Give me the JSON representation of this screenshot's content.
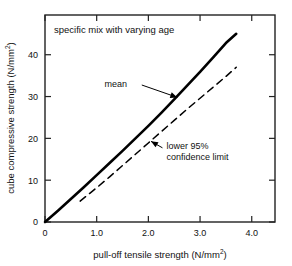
{
  "chart_data": {
    "type": "line",
    "title": "specific mix with varying age",
    "title_position": "inside-top-left",
    "xlabel_main": "pull-off tensile strength (N/mm",
    "xlabel_sup": "2",
    "xlabel_tail": ")",
    "xlabel_full": "pull-off tensile strength (N/mm2)",
    "ylabel_main": "cube compressive strength (N/mm",
    "ylabel_sup": "2",
    "ylabel_tail": ")",
    "ylabel_full": "cube compressive strength (N/mm2)",
    "xlim": [
      0,
      4.45
    ],
    "ylim": [
      0,
      49.5
    ],
    "xticks": [
      0,
      1.0,
      2.0,
      3.0,
      4.0
    ],
    "xticklabels": [
      "0",
      "1.0",
      "2.0",
      "3.0",
      "4.0"
    ],
    "yticks": [
      0,
      10,
      20,
      30,
      40
    ],
    "yticklabels": [
      "0",
      "10",
      "20",
      "30",
      "40"
    ],
    "grid": false,
    "legend": "none",
    "frame": "box",
    "tick_direction": "in",
    "series": [
      {
        "name": "mean",
        "style": "solid",
        "color": "#000000",
        "linewidth": 2.6,
        "x": [
          0.0,
          0.25,
          0.5,
          0.75,
          1.0,
          1.25,
          1.5,
          1.75,
          2.0,
          2.25,
          2.5,
          2.75,
          3.0,
          3.25,
          3.5,
          3.7
        ],
        "y": [
          0.0,
          2.7,
          5.5,
          8.3,
          11.2,
          14.1,
          17.0,
          20.0,
          23.0,
          26.1,
          29.3,
          32.6,
          35.9,
          39.3,
          42.8,
          45.0
        ]
      },
      {
        "name": "lower 95% confidence limit",
        "style": "dashed",
        "color": "#000000",
        "linewidth": 1.5,
        "x": [
          0.68,
          1.0,
          1.25,
          1.5,
          1.75,
          2.0,
          2.25,
          2.5,
          2.75,
          3.0,
          3.25,
          3.5,
          3.7
        ],
        "y": [
          5.0,
          8.2,
          10.8,
          13.5,
          16.2,
          18.9,
          21.6,
          24.3,
          27.0,
          29.6,
          32.2,
          34.8,
          37.0
        ]
      }
    ],
    "annotations": [
      {
        "name": "mean",
        "label": "mean",
        "text_x": 1.37,
        "text_y": 33.0,
        "arrow_tip_x": 2.56,
        "arrow_tip_y": 29.8
      },
      {
        "name": "lower-95-confidence-limit",
        "label_line1": "lower 95%",
        "label_line2": "confidence limit",
        "text_x": 2.35,
        "text_y": 17.5,
        "arrow_tip_x": 2.05,
        "arrow_tip_y": 19.3
      }
    ]
  }
}
